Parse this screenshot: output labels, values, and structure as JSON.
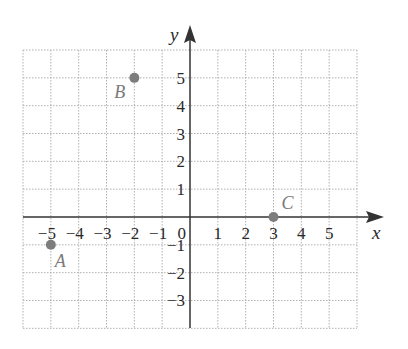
{
  "chart_data": {
    "type": "scatter",
    "title": "",
    "xlabel": "x",
    "ylabel": "y",
    "xlim": [
      -6,
      6
    ],
    "ylim": [
      -4,
      6
    ],
    "grid": true,
    "x_ticks": [
      "-5",
      "-4",
      "-3",
      "-2",
      "-1",
      "1",
      "2",
      "3",
      "4",
      "5"
    ],
    "y_ticks": [
      "5",
      "4",
      "3",
      "2",
      "1",
      "-1",
      "-2",
      "-3"
    ],
    "origin_label": "0",
    "points": [
      {
        "label": "A",
        "x": -5,
        "y": -1
      },
      {
        "label": "B",
        "x": -2,
        "y": 5
      },
      {
        "label": "C",
        "x": 3,
        "y": 0
      }
    ],
    "colors": {
      "point": "#7d7d7d",
      "grid": "#b0b0b0",
      "axis": "#333333"
    }
  }
}
